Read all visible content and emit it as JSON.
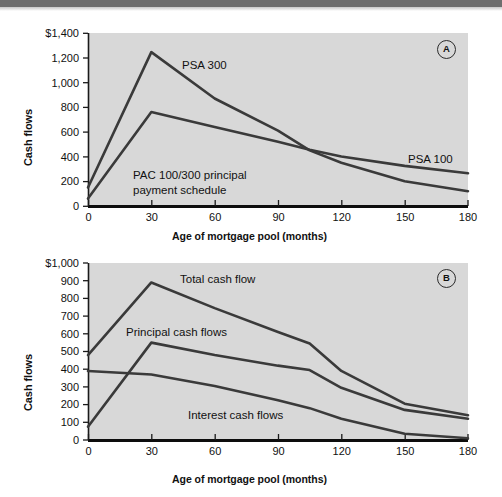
{
  "figure": {
    "background_color": "#ffffff",
    "plot_background_color": "#d8d8d8",
    "line_color": "#3a3a3a",
    "axis_color": "#1a1a1a"
  },
  "panel_a": {
    "badge": "A",
    "ylabel": "Cash flows",
    "xlabel": "Age of mortgage pool (months)",
    "y_ticks": [
      "0",
      "200",
      "400",
      "600",
      "800",
      "1,000",
      "1,200",
      "$1,400"
    ],
    "x_ticks": [
      "0",
      "30",
      "60",
      "90",
      "120",
      "150",
      "180"
    ],
    "labels": {
      "psa300": "PSA 300",
      "psa100": "PSA 100",
      "pac": "PAC 100/300 principal\npayment schedule",
      "pac_line1": "PAC 100/300 principal",
      "pac_line2": "payment schedule"
    }
  },
  "panel_b": {
    "badge": "B",
    "ylabel": "Cash flows",
    "xlabel": "Age of mortgage pool (months)",
    "y_ticks": [
      "0",
      "100",
      "200",
      "300",
      "400",
      "500",
      "600",
      "700",
      "800",
      "900",
      "$1,000"
    ],
    "x_ticks": [
      "0",
      "30",
      "60",
      "90",
      "120",
      "150",
      "180"
    ],
    "labels": {
      "total": "Total cash flow",
      "principal": "Principal cash flows",
      "interest": "Interest cash flows"
    }
  },
  "chart_data": [
    {
      "type": "line",
      "id": "panel-a",
      "title": "",
      "xlabel": "Age of mortgage pool (months)",
      "ylabel": "Cash flows",
      "xlim": [
        0,
        180
      ],
      "ylim": [
        0,
        1400
      ],
      "xticks": [
        0,
        30,
        60,
        90,
        120,
        150,
        180
      ],
      "yticks": [
        0,
        200,
        400,
        600,
        800,
        1000,
        1200,
        1400
      ],
      "grid": false,
      "legend": "inline-annotations",
      "annotations": [
        {
          "text": "PSA 300",
          "x": 52,
          "y": 1110
        },
        {
          "text": "PSA 100",
          "x": 152,
          "y": 430
        },
        {
          "text": "PAC 100/300 principal payment schedule",
          "x": 30,
          "y": 250
        }
      ],
      "series": [
        {
          "name": "PSA 300",
          "x": [
            0,
            30,
            60,
            90,
            105,
            120,
            150,
            180
          ],
          "y": [
            150,
            1245,
            870,
            610,
            450,
            350,
            200,
            120
          ]
        },
        {
          "name": "PAC 100/300 principal payment schedule (PSA 100)",
          "x": [
            0,
            30,
            60,
            90,
            105,
            120,
            150,
            180
          ],
          "y": [
            60,
            760,
            640,
            520,
            455,
            400,
            325,
            265
          ]
        }
      ]
    },
    {
      "type": "line",
      "id": "panel-b",
      "title": "",
      "xlabel": "Age of mortgage pool (months)",
      "ylabel": "Cash flows",
      "xlim": [
        0,
        180
      ],
      "ylim": [
        0,
        1000
      ],
      "xticks": [
        0,
        30,
        60,
        90,
        120,
        150,
        180
      ],
      "yticks": [
        0,
        100,
        200,
        300,
        400,
        500,
        600,
        700,
        800,
        900,
        1000
      ],
      "grid": false,
      "legend": "inline-annotations",
      "annotations": [
        {
          "text": "Total cash flow",
          "x": 52,
          "y": 880
        },
        {
          "text": "Principal cash flows",
          "x": 23,
          "y": 620
        },
        {
          "text": "Interest cash flows",
          "x": 56,
          "y": 115
        }
      ],
      "series": [
        {
          "name": "Total cash flow",
          "x": [
            0,
            30,
            60,
            90,
            105,
            120,
            150,
            180
          ],
          "y": [
            480,
            890,
            745,
            610,
            545,
            390,
            205,
            140
          ]
        },
        {
          "name": "Principal cash flows",
          "x": [
            0,
            30,
            60,
            90,
            105,
            120,
            150,
            180
          ],
          "y": [
            75,
            550,
            480,
            420,
            395,
            295,
            170,
            120
          ]
        },
        {
          "name": "Interest cash flows",
          "x": [
            0,
            30,
            60,
            90,
            105,
            120,
            150,
            180
          ],
          "y": [
            390,
            370,
            305,
            225,
            180,
            120,
            35,
            10
          ]
        }
      ]
    }
  ]
}
